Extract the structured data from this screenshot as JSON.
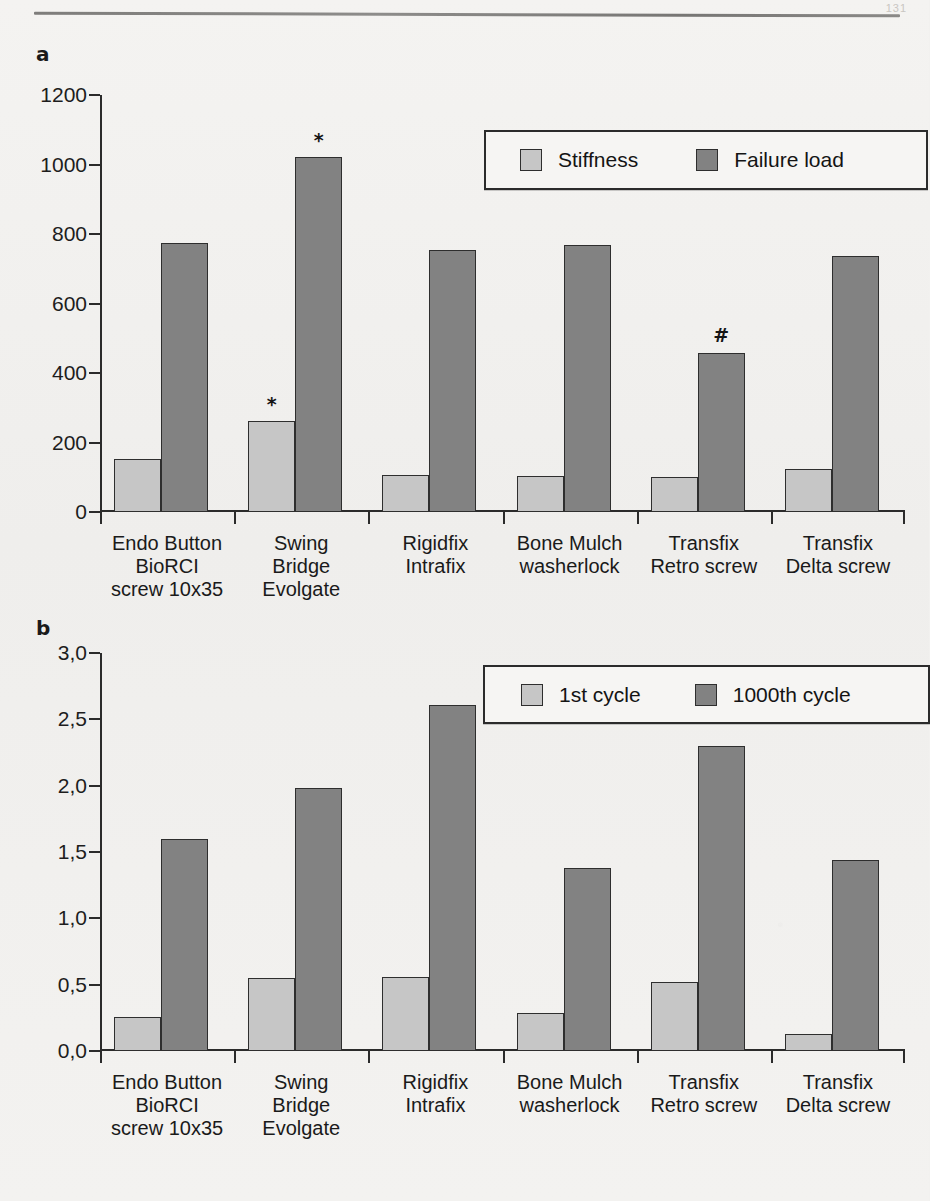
{
  "page": {
    "number": "131"
  },
  "figure": {
    "panel_a_letter": "a",
    "panel_b_letter": "b"
  },
  "chart_data": [
    {
      "panel": "a",
      "type": "bar",
      "title": "",
      "xlabel": "",
      "ylabel": "",
      "ylim": [
        0,
        1200
      ],
      "ytick_labels": [
        "0",
        "200",
        "400",
        "600",
        "800",
        "1000",
        "1200"
      ],
      "ytick_values": [
        0,
        200,
        400,
        600,
        800,
        1000,
        1200
      ],
      "grid": false,
      "legend_position": "top-right",
      "categories": [
        "Endo Button\nBioRCI\nscrew 10x35",
        "Swing\nBridge\nEvolgate",
        "Rigidfix\nIntrafix",
        "Bone Mulch\nwasherlock",
        "Transfix\nRetro screw",
        "Transfix\nDelta screw"
      ],
      "series": [
        {
          "name": "Stiffness",
          "color": "#c6c6c6",
          "values": [
            153,
            263,
            107,
            104,
            101,
            123
          ]
        },
        {
          "name": "Failure load",
          "color": "#828282",
          "values": [
            774,
            1023,
            753,
            769,
            459,
            737
          ]
        }
      ],
      "annotations": [
        {
          "text": "*",
          "series": "Stiffness",
          "category_index": 1
        },
        {
          "text": "*",
          "series": "Failure load",
          "category_index": 1
        },
        {
          "text": "#",
          "series": "Failure load",
          "category_index": 4
        }
      ]
    },
    {
      "panel": "b",
      "type": "bar",
      "title": "",
      "xlabel": "",
      "ylabel": "",
      "ylim": [
        0,
        3.0
      ],
      "ytick_labels": [
        "0,0",
        "0,5",
        "1,0",
        "1,5",
        "2,0",
        "2,5",
        "3,0"
      ],
      "ytick_values": [
        0,
        0.5,
        1.0,
        1.5,
        2.0,
        2.5,
        3.0
      ],
      "grid": false,
      "legend_position": "top-right",
      "categories": [
        "Endo Button\nBioRCI\nscrew 10x35",
        "Swing\nBridge\nEvolgate",
        "Rigidfix\nIntrafix",
        "Bone Mulch\nwasherlock",
        "Transfix\nRetro screw",
        "Transfix\nDelta screw"
      ],
      "series": [
        {
          "name": "1st cycle",
          "color": "#c6c6c6",
          "values": [
            0.26,
            0.55,
            0.56,
            0.29,
            0.52,
            0.13
          ]
        },
        {
          "name": "1000th cycle",
          "color": "#828282",
          "values": [
            1.6,
            1.98,
            2.61,
            1.38,
            2.3,
            1.44
          ]
        }
      ],
      "annotations": []
    }
  ]
}
